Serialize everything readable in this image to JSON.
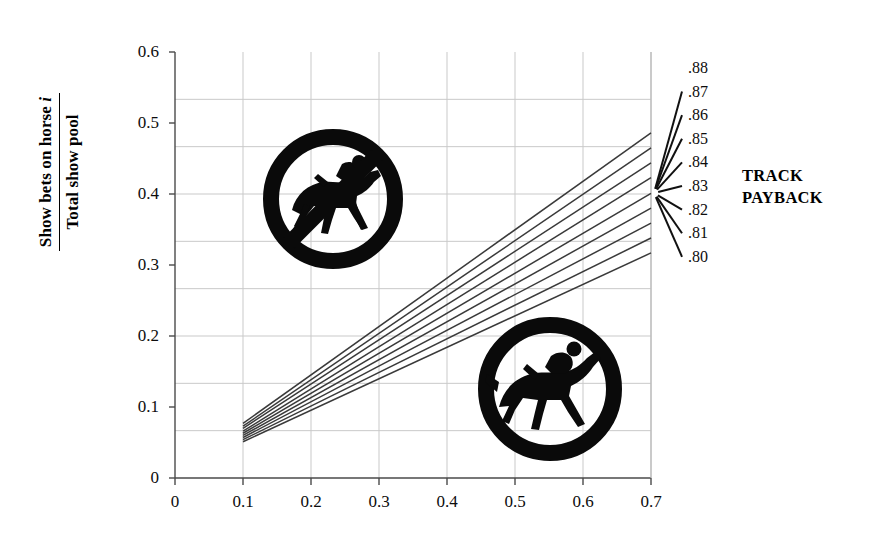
{
  "chart_data": {
    "type": "line",
    "title": "",
    "xlabel": "Win bets on horse i",
    "ylabel_numerator": "Show bets on horse i",
    "ylabel_denominator": "Total show pool",
    "xlim": [
      0,
      0.7
    ],
    "ylim": [
      0,
      0.6
    ],
    "xticks": [
      "0",
      "0.1",
      "0.2",
      "0.3",
      "0.4",
      "0.5",
      "0.6",
      "0.7"
    ],
    "xtick_values": [
      0,
      0.1,
      0.2,
      0.3,
      0.4,
      0.5,
      0.6,
      0.7
    ],
    "yticks": [
      "0",
      "0.1",
      "0.2",
      "0.3",
      "0.4",
      "0.5",
      "0.6"
    ],
    "ytick_values": [
      0,
      0.1,
      0.2,
      0.3,
      0.4,
      0.5,
      0.6
    ],
    "grid": true,
    "grid_color": "#c9c9c9",
    "line_color": "#3a3a3a",
    "legend_title": [
      "TRACK",
      "PAYBACK"
    ],
    "legend_position": "right",
    "x": [
      0.1,
      0.7
    ],
    "series": [
      {
        "name": ".88",
        "values": [
          0.077,
          0.486
        ]
      },
      {
        "name": ".87",
        "values": [
          0.073,
          0.465
        ]
      },
      {
        "name": ".86",
        "values": [
          0.07,
          0.444
        ]
      },
      {
        "name": ".85",
        "values": [
          0.066,
          0.423
        ]
      },
      {
        "name": ".84",
        "values": [
          0.063,
          0.401
        ]
      },
      {
        "name": ".83",
        "values": [
          0.06,
          0.38
        ]
      },
      {
        "name": ".82",
        "values": [
          0.057,
          0.359
        ]
      },
      {
        "name": ".81",
        "values": [
          0.054,
          0.338
        ]
      },
      {
        "name": ".80",
        "values": [
          0.051,
          0.317
        ]
      }
    ]
  },
  "legend": {
    "title_line1": "TRACK",
    "title_line2": "PAYBACK"
  },
  "emblems": [
    {
      "name": "no-horse-sign-icon",
      "label": "prohibited horse and jockey emblem"
    },
    {
      "name": "horse-jockey-icon",
      "label": "horse and jockey emblem"
    }
  ]
}
